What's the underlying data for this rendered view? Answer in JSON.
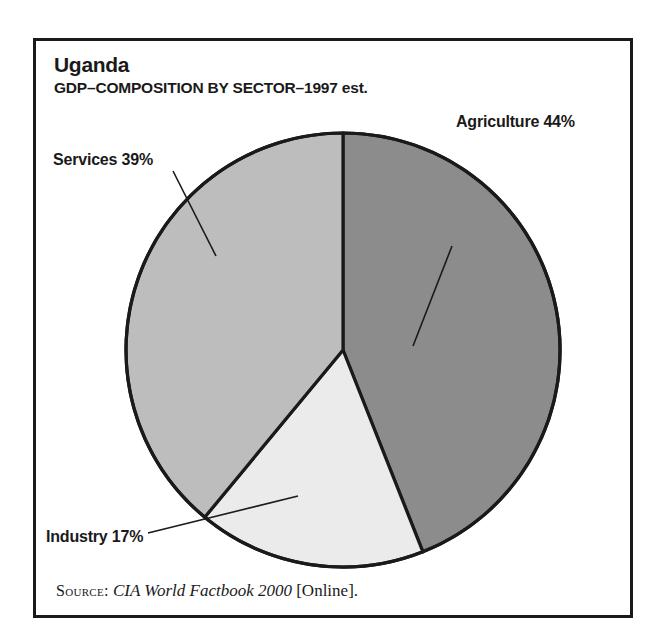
{
  "figure": {
    "title": "Uganda",
    "subtitle": "GDP–COMPOSITION BY SECTOR–1997 est.",
    "source_label": "Source:",
    "source_title": "CIA World Factbook 2000",
    "source_suffix": "[Online].",
    "frame_color": "#1a1a1a",
    "background": "#ffffff"
  },
  "labels": {
    "agriculture": "Agriculture 44%",
    "services": "Services 39%",
    "industry": "Industry 17%"
  },
  "chart_data": {
    "type": "pie",
    "title": "Uganda",
    "subtitle": "GDP–COMPOSITION BY SECTOR–1997 est.",
    "xlabel": "",
    "ylabel": "",
    "units": "percent",
    "start_angle_deg": 0,
    "direction": "clockwise",
    "legend": "none, labels with leader lines",
    "grid": false,
    "categories": [
      "Agriculture",
      "Industry",
      "Services"
    ],
    "values": [
      44,
      17,
      39
    ],
    "labels": [
      "Agriculture 44%",
      "Industry 17%",
      "Services 39%"
    ],
    "colors": [
      "#8c8c8c",
      "#ebebeb",
      "#bdbdbd"
    ],
    "slices": [
      {
        "name": "Agriculture",
        "value": 44,
        "label": "Agriculture 44%",
        "color": "#8c8c8c",
        "start_deg": 0,
        "end_deg": 158.4
      },
      {
        "name": "Industry",
        "value": 17,
        "label": "Industry 17%",
        "color": "#ebebeb",
        "start_deg": 158.4,
        "end_deg": 219.6
      },
      {
        "name": "Services",
        "value": 39,
        "label": "Services 39%",
        "color": "#bdbdbd",
        "start_deg": 219.6,
        "end_deg": 360
      }
    ],
    "total": 100,
    "source": "CIA World Factbook 2000 [Online]."
  }
}
